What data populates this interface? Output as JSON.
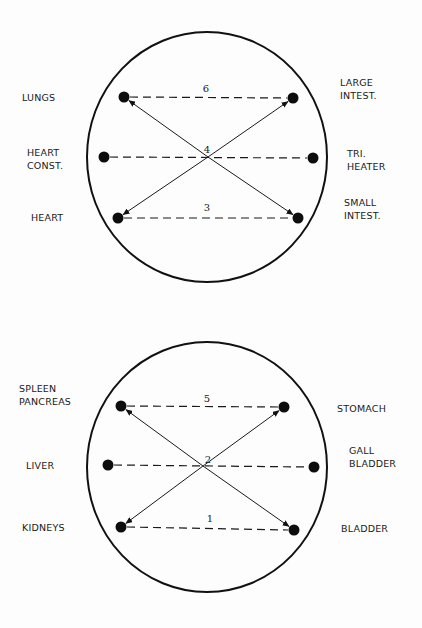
{
  "colors": {
    "background": "#fdfdfd",
    "ink": "#111111"
  },
  "diagrams": [
    {
      "id": "top",
      "circle": {
        "cx": 207,
        "cy": 157,
        "rx": 120,
        "ry": 125
      },
      "center_number": {
        "text": "4",
        "x": 207,
        "y": 153
      },
      "cross_point": {
        "x": 208,
        "y": 157
      },
      "nodes": [
        {
          "key": "lungs",
          "x": 124,
          "y": 97,
          "label_lines": [
            "LUNGS"
          ],
          "label_x": 22,
          "label_y": 97,
          "anchor": "start"
        },
        {
          "key": "large-intestine",
          "x": 293,
          "y": 98,
          "label_lines": [
            "LARGE",
            "INTEST."
          ],
          "label_x": 340,
          "label_y": 86,
          "anchor": "start"
        },
        {
          "key": "heart-constrictor",
          "x": 104,
          "y": 157,
          "label_lines": [
            "HEART",
            "CONST."
          ],
          "label_x": 27,
          "label_y": 156,
          "anchor": "start"
        },
        {
          "key": "triple-heater",
          "x": 313,
          "y": 158,
          "label_lines": [
            "TRI.",
            "HEATER"
          ],
          "label_x": 347,
          "label_y": 157,
          "anchor": "start"
        },
        {
          "key": "heart",
          "x": 118,
          "y": 218,
          "label_lines": [
            "HEART"
          ],
          "label_x": 31,
          "label_y": 217,
          "anchor": "start"
        },
        {
          "key": "small-intestine",
          "x": 298,
          "y": 218,
          "label_lines": [
            "SMALL",
            "INTEST."
          ],
          "label_x": 344,
          "label_y": 206,
          "anchor": "start"
        }
      ],
      "dashed_pairs": [
        {
          "from": "lungs",
          "to": "large-intestine",
          "number": "6",
          "num_x": 206,
          "num_y": 92
        },
        {
          "from": "heart-constrictor",
          "to": "triple-heater",
          "number": "",
          "num_x": 0,
          "num_y": 0
        },
        {
          "from": "heart",
          "to": "small-intestine",
          "number": "3",
          "num_x": 207,
          "num_y": 211
        }
      ],
      "arrows": [
        {
          "from": "small-intestine",
          "to": "lungs"
        },
        {
          "from": "lungs",
          "to": "small-intestine"
        },
        {
          "from": "heart",
          "to": "large-intestine"
        },
        {
          "from": "large-intestine",
          "to": "heart"
        }
      ]
    },
    {
      "id": "bottom",
      "circle": {
        "cx": 207,
        "cy": 467,
        "rx": 120,
        "ry": 125
      },
      "center_number": {
        "text": "2",
        "x": 208,
        "y": 463
      },
      "cross_point": {
        "x": 203,
        "y": 466
      },
      "nodes": [
        {
          "key": "spleen-pancreas",
          "x": 121,
          "y": 406,
          "label_lines": [
            "SPLEEN",
            "PANCREAS"
          ],
          "label_x": 19,
          "label_y": 392,
          "anchor": "start"
        },
        {
          "key": "stomach",
          "x": 284,
          "y": 407,
          "label_lines": [
            "STOMACH"
          ],
          "label_x": 337,
          "label_y": 408,
          "anchor": "start"
        },
        {
          "key": "liver",
          "x": 108,
          "y": 465,
          "label_lines": [
            "LIVER"
          ],
          "label_x": 26,
          "label_y": 465,
          "anchor": "start"
        },
        {
          "key": "gall-bladder",
          "x": 314,
          "y": 467,
          "label_lines": [
            "GALL",
            "BLADDER"
          ],
          "label_x": 349,
          "label_y": 454,
          "anchor": "start"
        },
        {
          "key": "kidneys",
          "x": 121,
          "y": 527,
          "label_lines": [
            "KIDNEYS"
          ],
          "label_x": 22,
          "label_y": 527,
          "anchor": "start"
        },
        {
          "key": "bladder",
          "x": 294,
          "y": 530,
          "label_lines": [
            "BLADDER"
          ],
          "label_x": 341,
          "label_y": 528,
          "anchor": "start"
        }
      ],
      "dashed_pairs": [
        {
          "from": "spleen-pancreas",
          "to": "stomach",
          "number": "5",
          "num_x": 207,
          "num_y": 402
        },
        {
          "from": "liver",
          "to": "gall-bladder",
          "number": "",
          "num_x": 0,
          "num_y": 0
        },
        {
          "from": "kidneys",
          "to": "bladder",
          "number": "1",
          "num_x": 210,
          "num_y": 522
        }
      ],
      "arrows": [
        {
          "from": "bladder",
          "to": "spleen-pancreas"
        },
        {
          "from": "spleen-pancreas",
          "to": "bladder"
        },
        {
          "from": "kidneys",
          "to": "stomach"
        },
        {
          "from": "stomach",
          "to": "kidneys"
        }
      ]
    }
  ]
}
